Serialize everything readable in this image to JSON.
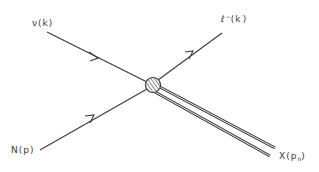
{
  "diagram": {
    "type": "feynman-diagram",
    "vertex": {
      "shape": "hatched-circle"
    },
    "particles": {
      "incoming_neutrino": {
        "symbol": "ν",
        "momentum": "(k)"
      },
      "incoming_nucleon": {
        "symbol": "N",
        "momentum": "(p)"
      },
      "outgoing_lepton": {
        "symbol": "ℓ",
        "charge": "−",
        "momentum_open": "(k",
        "momentum_prime": "′",
        "momentum_close": ")"
      },
      "outgoing_hadrons": {
        "symbol": "X",
        "momentum_open": "(p",
        "momentum_sub": "n",
        "momentum_close": ")"
      }
    },
    "colors": {
      "line": "#3a3a3a",
      "background": "#ffffff"
    }
  }
}
